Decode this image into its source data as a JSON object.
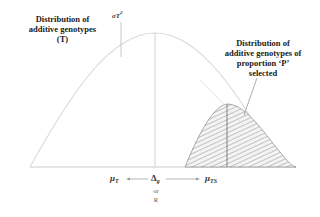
{
  "labels": {
    "total_distribution": [
      "Distribution of",
      "additive genotypes",
      "(T)"
    ],
    "selected_distribution": [
      "Distribution of",
      "additive genotypes of",
      "proportion ‘P’",
      "selected"
    ],
    "variance_symbol": "σT",
    "variance_exp": "2",
    "mu_t": "μ",
    "mu_t_sub": "T",
    "delta_g": "Δ",
    "delta_g_sub": "g",
    "or": "or",
    "r": "R",
    "mu_ts": "μ",
    "mu_ts_sub": "TS"
  },
  "colors": {
    "curve": "#d8d8d8",
    "hatch": "#555555",
    "text": "#222222"
  }
}
